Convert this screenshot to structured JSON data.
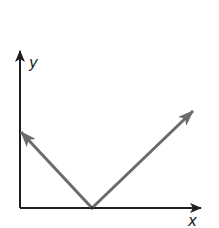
{
  "diagram": {
    "type": "coordinate-vectors",
    "axes": {
      "x_label": "x",
      "y_label": "y",
      "origin": [
        20,
        208
      ],
      "x_axis_end": [
        201,
        208
      ],
      "y_axis_end": [
        20,
        50
      ]
    },
    "vertex": [
      92,
      208
    ],
    "vectors": [
      {
        "name": "left-vector",
        "from": [
          92,
          208
        ],
        "to": [
          20,
          132
        ]
      },
      {
        "name": "right-vector",
        "from": [
          92,
          208
        ],
        "to": [
          193,
          111
        ]
      }
    ],
    "colors": {
      "axis": "#1f1f1f",
      "vector": "#6b6b6b",
      "background": "#ffffff"
    }
  }
}
